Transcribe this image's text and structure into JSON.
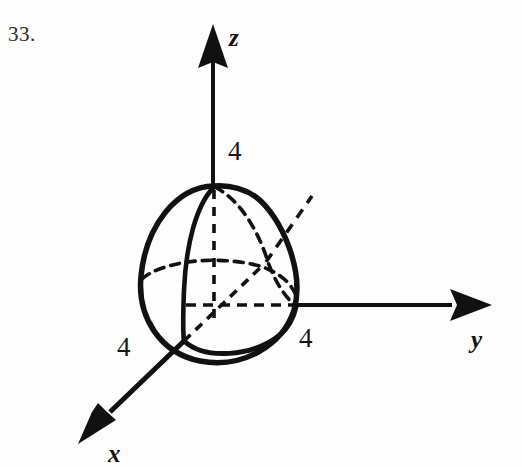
{
  "figure": {
    "problem_number": "33.",
    "background_color": "#fdfdfd",
    "ink_color": "#111111"
  },
  "axes": {
    "z": {
      "label": "z",
      "tick_label": "4",
      "direction": "up"
    },
    "y": {
      "label": "y",
      "tick_label": "4",
      "direction": "right"
    },
    "x": {
      "label": "x",
      "tick_label": "4",
      "direction": "down-left"
    }
  },
  "solid": {
    "name": "hemisphere",
    "radius": 4,
    "apex_label": "4"
  }
}
